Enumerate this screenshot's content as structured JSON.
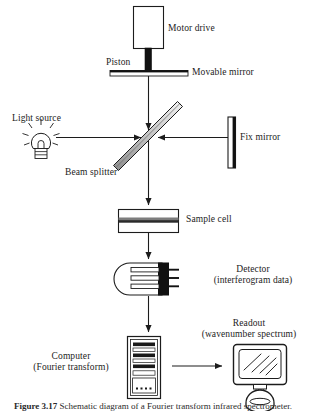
{
  "figure": {
    "caption_prefix": "Figure 3.17",
    "caption_rest": "Schematic diagram of a Fourier transform infrared spectrometer."
  },
  "labels": {
    "motor_drive": "Motor drive",
    "piston": "Piston",
    "movable_mirror": "Movable mirror",
    "light_source": "Light source",
    "fix_mirror": "Fix mirror",
    "beam_splitter": "Beam splitter",
    "sample_cell": "Sample cell",
    "detector_line1": "Detector",
    "detector_line2": "(interferogram data)",
    "computer_line1": "Computer",
    "computer_line2": "(Fourier transform)",
    "readout_line1": "Readout",
    "readout_line2": "(wavenumber spectrum)"
  },
  "colors": {
    "stroke": "#1c1c1c",
    "fill_white": "#ffffff",
    "fill_black": "#111111",
    "fill_gray": "#9a9a9a",
    "fill_light": "#e8e8e8",
    "text": "#1c1c1c",
    "background": "#ffffff"
  },
  "components": [
    {
      "id": "motor-drive",
      "shape": "rectangle",
      "x": 133,
      "y": 6,
      "w": 31,
      "h": 42
    },
    {
      "id": "piston",
      "shape": "vertical-bar",
      "x": 145,
      "y": 48,
      "w": 6,
      "h": 24
    },
    {
      "id": "movable-mirror",
      "shape": "horizontal-plate",
      "x": 110,
      "y": 70,
      "w": 78,
      "h": 6
    },
    {
      "id": "light-source",
      "shape": "bulb",
      "cx": 41,
      "cy": 142,
      "r": 11
    },
    {
      "id": "beam-splitter",
      "shape": "diagonal-plate",
      "x1": 115,
      "y1": 165,
      "x2": 180,
      "y2": 106
    },
    {
      "id": "fix-mirror",
      "shape": "vertical-plate",
      "x": 228,
      "y": 117,
      "w": 7,
      "h": 50
    },
    {
      "id": "sample-cell",
      "shape": "rectangle-with-bands",
      "x": 118,
      "y": 209,
      "w": 54,
      "h": 24
    },
    {
      "id": "detector",
      "shape": "detector-capsule",
      "x": 112,
      "y": 262,
      "w": 60,
      "h": 34
    },
    {
      "id": "computer",
      "shape": "tower",
      "x": 127,
      "y": 336,
      "w": 32,
      "h": 62
    },
    {
      "id": "readout-monitor",
      "shape": "crt-monitor",
      "x": 233,
      "y": 344,
      "w": 54,
      "h": 54
    }
  ],
  "beams": [
    {
      "id": "beam-source-to-splitter",
      "from": "light-source",
      "to": "beam-splitter",
      "direction": "right",
      "arrow": true
    },
    {
      "id": "beam-movable-mirror-down",
      "from": "movable-mirror",
      "to": "beam-splitter",
      "direction": "down",
      "arrow": true
    },
    {
      "id": "beam-fix-mirror-left",
      "from": "fix-mirror",
      "to": "beam-splitter",
      "direction": "left",
      "arrow": true
    },
    {
      "id": "beam-splitter-to-sample",
      "from": "beam-splitter",
      "to": "sample-cell",
      "direction": "down",
      "arrow": true
    },
    {
      "id": "beam-sample-to-detector",
      "from": "sample-cell",
      "to": "detector",
      "direction": "down",
      "arrow": true
    },
    {
      "id": "beam-detector-to-computer",
      "from": "detector",
      "to": "computer",
      "direction": "down",
      "arrow": true
    },
    {
      "id": "beam-computer-to-readout",
      "from": "computer",
      "to": "readout-monitor",
      "direction": "right",
      "arrow": true
    }
  ]
}
